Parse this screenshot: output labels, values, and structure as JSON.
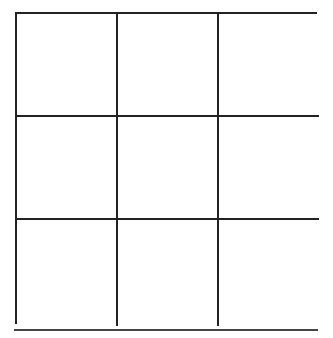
{
  "grid": {
    "rows": 3,
    "columns": 3,
    "cells": [
      [
        "",
        "",
        ""
      ],
      [
        "",
        "",
        ""
      ],
      [
        "",
        "",
        ""
      ]
    ],
    "line_color": "#222222",
    "background": "#ffffff"
  },
  "separator": {
    "color": "#444444"
  }
}
